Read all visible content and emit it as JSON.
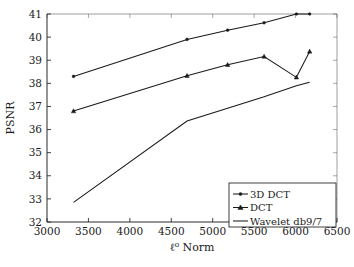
{
  "chart_data": {
    "type": "line",
    "title": "",
    "xlabel": "ℓ⁰ Norm",
    "ylabel": "PSNR",
    "xlim": [
      3000,
      6500
    ],
    "ylim": [
      32,
      41
    ],
    "xticks": [
      3000,
      3500,
      4000,
      4500,
      5000,
      5500,
      6000,
      6500
    ],
    "yticks": [
      32,
      33,
      34,
      35,
      36,
      37,
      38,
      39,
      40,
      41
    ],
    "xtick_labels": [
      "3000",
      "3500",
      "4000",
      "4500",
      "5000",
      "5500",
      "6000",
      "6500"
    ],
    "ytick_labels": [
      "32",
      "33",
      "34",
      "35",
      "36",
      "37",
      "38",
      "39",
      "40",
      "41"
    ],
    "grid": false,
    "legend_position": "lower right",
    "series": [
      {
        "name": "3D DCT",
        "marker": "dot",
        "x": [
          3320,
          4690,
          5180,
          5620,
          6010,
          6170
        ],
        "y": [
          38.3,
          39.9,
          40.3,
          40.62,
          41.0,
          41.0
        ]
      },
      {
        "name": "DCT",
        "marker": "triangle",
        "x": [
          3320,
          4690,
          5180,
          5620,
          6010,
          6170
        ],
        "y": [
          36.8,
          38.33,
          38.8,
          39.16,
          38.26,
          39.38
        ]
      },
      {
        "name": "Wavelet db9/7",
        "marker": "none",
        "x": [
          3320,
          4690,
          5180,
          5620,
          6010,
          6170
        ],
        "y": [
          32.85,
          36.37,
          36.92,
          37.42,
          37.9,
          38.05
        ]
      }
    ],
    "plot_order_top_to_bottom": [
      "3D DCT",
      "DCT",
      "Wavelet db9/7"
    ]
  },
  "legend": {
    "entries": [
      {
        "label": "3D DCT",
        "marker": "dot"
      },
      {
        "label": "DCT",
        "marker": "triangle"
      },
      {
        "label": "Wavelet db9/7",
        "marker": "none"
      }
    ]
  },
  "axes": {
    "x_title": "ℓ⁰ Norm",
    "y_title": "PSNR"
  }
}
